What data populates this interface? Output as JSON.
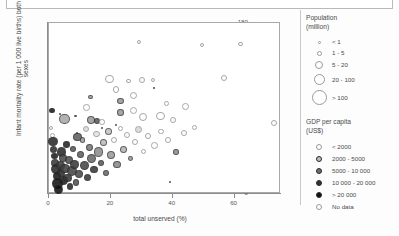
{
  "top_strip": {
    "ghost_text": ""
  },
  "chart_data": {
    "type": "scatter",
    "title": "",
    "xlabel": "total unserved (%)",
    "ylabel": "Infant mortality rate (per 1 000 live births) both sexes",
    "xlim": [
      0,
      75
    ],
    "ylim": [
      0,
      180
    ],
    "xticks": [
      0,
      20,
      40,
      60
    ],
    "yticks": [
      0,
      20,
      40,
      60,
      80,
      100,
      120,
      140,
      160,
      180
    ],
    "grid": false,
    "legend_position": "right",
    "size_legend": {
      "title_line1": "Population",
      "title_line2": "(million)",
      "entries": [
        {
          "label": "< 1",
          "px": 3
        },
        {
          "label": "1 - 5",
          "px": 5
        },
        {
          "label": "5 - 20",
          "px": 8
        },
        {
          "label": "20 - 100",
          "px": 11
        },
        {
          "label": "> 100",
          "px": 15
        }
      ]
    },
    "color_legend": {
      "title_line1": "GDP per capita",
      "title_line2": "(US$)",
      "entries": [
        {
          "label": "< 2000",
          "fill": "#ffffff"
        },
        {
          "label": "2000 - 5000",
          "fill": "#bdbdbd"
        },
        {
          "label": "5000 - 10 000",
          "fill": "#6e6e6e"
        },
        {
          "label": "10 000 - 20 000",
          "fill": "#333333"
        },
        {
          "label": "> 20 000",
          "fill": "#111111"
        },
        {
          "label": "No data",
          "fill": "#ffffff"
        }
      ]
    },
    "points": [
      {
        "x": 1.0,
        "y": 88,
        "r": 2.6,
        "fill": "#1a1a1a"
      },
      {
        "x": 3.5,
        "y": 84,
        "r": 1.3,
        "fill": "#7a7a7a"
      },
      {
        "x": 5.0,
        "y": 79,
        "r": 5.4,
        "fill": "#a8a8a8"
      },
      {
        "x": 8.6,
        "y": 82,
        "r": 1.3,
        "fill": "#8a8a8a"
      },
      {
        "x": 12.0,
        "y": 91,
        "r": 3.4,
        "fill": "#ffffff"
      },
      {
        "x": 13.3,
        "y": 102,
        "r": 2.4,
        "fill": "#9a9a9a"
      },
      {
        "x": 13.6,
        "y": 78,
        "r": 4.4,
        "fill": "#9a9a9a"
      },
      {
        "x": 15.4,
        "y": 77,
        "r": 3.1,
        "fill": "#5a5a5a"
      },
      {
        "x": 17.2,
        "y": 76,
        "r": 2.8,
        "fill": "#ffffff"
      },
      {
        "x": 19.6,
        "y": 121,
        "r": 4.4,
        "fill": "#ffffff"
      },
      {
        "x": 21.6,
        "y": 110,
        "r": 3.3,
        "fill": "#ffffff"
      },
      {
        "x": 23.2,
        "y": 98,
        "r": 3.3,
        "fill": "#9a9a9a"
      },
      {
        "x": 23.2,
        "y": 86,
        "r": 3.3,
        "fill": "#9a9a9a"
      },
      {
        "x": 25.6,
        "y": 119,
        "r": 2.4,
        "fill": "#ffffff"
      },
      {
        "x": 27.3,
        "y": 104,
        "r": 3.6,
        "fill": "#ffffff"
      },
      {
        "x": 27.3,
        "y": 88,
        "r": 3.6,
        "fill": "#ffffff"
      },
      {
        "x": 29.0,
        "y": 160,
        "r": 2.1,
        "fill": "#ffffff"
      },
      {
        "x": 30.2,
        "y": 120,
        "r": 3.0,
        "fill": "#ffffff"
      },
      {
        "x": 30.5,
        "y": 81,
        "r": 4.0,
        "fill": "#ffffff"
      },
      {
        "x": 33.6,
        "y": 120,
        "r": 2.1,
        "fill": "#ffffff"
      },
      {
        "x": 34.1,
        "y": 112,
        "r": 1.0,
        "fill": "#4a4a4a"
      },
      {
        "x": 36.0,
        "y": 82,
        "r": 4.3,
        "fill": "#ffffff"
      },
      {
        "x": 38.0,
        "y": 95,
        "r": 2.4,
        "fill": "#ffffff"
      },
      {
        "x": 40.0,
        "y": 78,
        "r": 3.2,
        "fill": "#ffffff"
      },
      {
        "x": 44.0,
        "y": 92,
        "r": 3.4,
        "fill": "#ffffff"
      },
      {
        "x": 49.5,
        "y": 157,
        "r": 2.2,
        "fill": "#ffffff"
      },
      {
        "x": 56.5,
        "y": 122,
        "r": 3.0,
        "fill": "#ffffff"
      },
      {
        "x": 62.0,
        "y": 158,
        "r": 2.3,
        "fill": "#ffffff"
      },
      {
        "x": 72.6,
        "y": 75,
        "r": 3.0,
        "fill": "#ffffff"
      },
      {
        "x": 0.7,
        "y": 70,
        "r": 2.0,
        "fill": "#ffffff"
      },
      {
        "x": 1.2,
        "y": 62,
        "r": 2.6,
        "fill": "#ffffff"
      },
      {
        "x": 1.3,
        "y": 55,
        "r": 4.6,
        "fill": "#2a2a2a"
      },
      {
        "x": 1.5,
        "y": 47,
        "r": 3.8,
        "fill": "#2f2f2f"
      },
      {
        "x": 1.8,
        "y": 40,
        "r": 3.4,
        "fill": "#1d1d1d"
      },
      {
        "x": 2.0,
        "y": 33,
        "r": 4.0,
        "fill": "#3a3a3a"
      },
      {
        "x": 2.2,
        "y": 26,
        "r": 5.0,
        "fill": "#2a2a2a"
      },
      {
        "x": 2.6,
        "y": 19,
        "r": 4.2,
        "fill": "#1a1a1a"
      },
      {
        "x": 2.8,
        "y": 11,
        "r": 5.2,
        "fill": "#141414"
      },
      {
        "x": 3.1,
        "y": 5,
        "r": 4.6,
        "fill": "#111111"
      },
      {
        "x": 3.6,
        "y": 30,
        "r": 4.4,
        "fill": "#3c3c3c"
      },
      {
        "x": 3.9,
        "y": 22,
        "r": 4.0,
        "fill": "#2e2e2e"
      },
      {
        "x": 4.1,
        "y": 44,
        "r": 4.8,
        "fill": "#2b2b2b"
      },
      {
        "x": 4.4,
        "y": 38,
        "r": 4.1,
        "fill": "#4a4a4a"
      },
      {
        "x": 4.8,
        "y": 14,
        "r": 4.4,
        "fill": "#1f1f1f"
      },
      {
        "x": 5.2,
        "y": 27,
        "r": 4.6,
        "fill": "#3f3f3f"
      },
      {
        "x": 5.6,
        "y": 52,
        "r": 3.3,
        "fill": "#252525"
      },
      {
        "x": 6.0,
        "y": 17,
        "r": 4.2,
        "fill": "#353535"
      },
      {
        "x": 6.4,
        "y": 36,
        "r": 4.0,
        "fill": "#4e4e4e"
      },
      {
        "x": 6.8,
        "y": 8,
        "r": 3.3,
        "fill": "#2a2a2a"
      },
      {
        "x": 7.4,
        "y": 24,
        "r": 5.0,
        "fill": "#454545"
      },
      {
        "x": 7.8,
        "y": 47,
        "r": 3.0,
        "fill": "#5a5a5a"
      },
      {
        "x": 8.2,
        "y": 31,
        "r": 4.2,
        "fill": "#3a3a3a"
      },
      {
        "x": 8.8,
        "y": 12,
        "r": 3.2,
        "fill": "#525252"
      },
      {
        "x": 9.3,
        "y": 60,
        "r": 4.3,
        "fill": "#606060"
      },
      {
        "x": 9.7,
        "y": 21,
        "r": 4.1,
        "fill": "#4a4a4a"
      },
      {
        "x": 10.2,
        "y": 42,
        "r": 3.6,
        "fill": "#5f5f5f"
      },
      {
        "x": 10.8,
        "y": 57,
        "r": 2.8,
        "fill": "#a0a0a0"
      },
      {
        "x": 11.4,
        "y": 30,
        "r": 4.4,
        "fill": "#464646"
      },
      {
        "x": 11.9,
        "y": 68,
        "r": 3.0,
        "fill": "#dcdcdc"
      },
      {
        "x": 12.4,
        "y": 17,
        "r": 3.6,
        "fill": "#3b3b3b"
      },
      {
        "x": 13.0,
        "y": 49,
        "r": 3.4,
        "fill": "#7a7a7a"
      },
      {
        "x": 13.8,
        "y": 37,
        "r": 4.6,
        "fill": "#6a6a6a"
      },
      {
        "x": 14.6,
        "y": 26,
        "r": 3.8,
        "fill": "#383838"
      },
      {
        "x": 15.3,
        "y": 63,
        "r": 3.2,
        "fill": "#e2e2e2"
      },
      {
        "x": 16.0,
        "y": 44,
        "r": 4.8,
        "fill": "#8e8e8e"
      },
      {
        "x": 16.8,
        "y": 33,
        "r": 3.0,
        "fill": "#5e5e5e"
      },
      {
        "x": 17.6,
        "y": 54,
        "r": 3.6,
        "fill": "#bdbdbd"
      },
      {
        "x": 18.4,
        "y": 22,
        "r": 3.3,
        "fill": "#6d6d6d"
      },
      {
        "x": 19.2,
        "y": 66,
        "r": 3.6,
        "fill": "#c6c6c6"
      },
      {
        "x": 20.0,
        "y": 41,
        "r": 4.2,
        "fill": "#9c9c9c"
      },
      {
        "x": 21.0,
        "y": 57,
        "r": 3.0,
        "fill": "#ffffff"
      },
      {
        "x": 22.0,
        "y": 31,
        "r": 3.8,
        "fill": "#8a8a8a"
      },
      {
        "x": 23.0,
        "y": 69,
        "r": 2.6,
        "fill": "#ffffff"
      },
      {
        "x": 24.0,
        "y": 47,
        "r": 3.6,
        "fill": "#b4b4b4"
      },
      {
        "x": 25.2,
        "y": 62,
        "r": 3.0,
        "fill": "#ffffff"
      },
      {
        "x": 26.4,
        "y": 37,
        "r": 2.4,
        "fill": "#9c9c9c"
      },
      {
        "x": 27.8,
        "y": 55,
        "r": 3.2,
        "fill": "#ffffff"
      },
      {
        "x": 29.0,
        "y": 68,
        "r": 3.4,
        "fill": "#d8d8d8"
      },
      {
        "x": 30.6,
        "y": 45,
        "r": 2.6,
        "fill": "#ffffff"
      },
      {
        "x": 32.0,
        "y": 61,
        "r": 3.0,
        "fill": "#ffffff"
      },
      {
        "x": 34.0,
        "y": 51,
        "r": 3.4,
        "fill": "#ffffff"
      },
      {
        "x": 36.2,
        "y": 66,
        "r": 2.8,
        "fill": "#ffffff"
      },
      {
        "x": 38.4,
        "y": 57,
        "r": 3.2,
        "fill": "#ffffff"
      },
      {
        "x": 41.0,
        "y": 44,
        "r": 2.8,
        "fill": "#8f8f8f"
      },
      {
        "x": 43.5,
        "y": 64,
        "r": 3.0,
        "fill": "#ffffff"
      },
      {
        "x": 47.0,
        "y": 70,
        "r": 2.6,
        "fill": "#ffffff"
      },
      {
        "x": 39.0,
        "y": 13,
        "r": 0.9,
        "fill": "#7a7a7a"
      },
      {
        "x": 17.0,
        "y": 70,
        "r": 0.9,
        "fill": "#6a6a6a"
      },
      {
        "x": 21.5,
        "y": 73,
        "r": 0.9,
        "fill": "#6a6a6a"
      },
      {
        "x": 9.0,
        "y": 64,
        "r": 1.0,
        "fill": "#5a5a5a"
      }
    ]
  }
}
